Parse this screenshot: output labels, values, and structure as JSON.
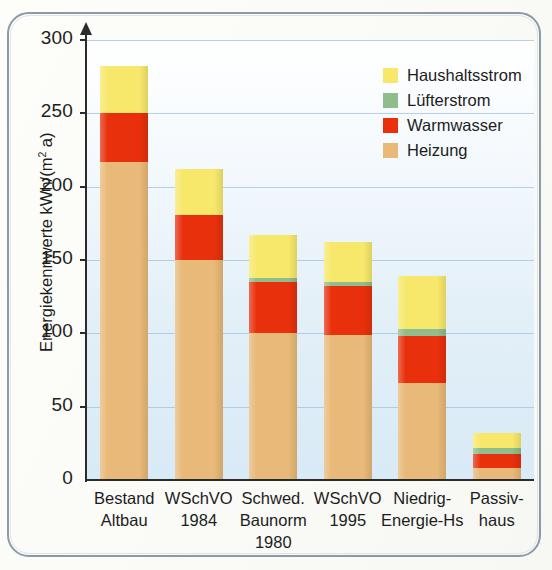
{
  "chart_data": {
    "type": "bar",
    "stacked": true,
    "title": "",
    "xlabel": "",
    "ylabel": "Energiekennwerte kWh/(m² a)",
    "ylim": [
      0,
      300
    ],
    "yticks": [
      0,
      50,
      100,
      150,
      200,
      250,
      300
    ],
    "grid": true,
    "legend_position": "top-right",
    "categories": [
      "Bestand Altbau",
      "WSchVO 1984",
      "Schwed. Baunorm 1980",
      "WSchVO 1995",
      "Niedrig-Energie-Hs",
      "Passivhaus"
    ],
    "category_lines": [
      [
        "Bestand",
        "Altbau"
      ],
      [
        "WSchVO",
        "1984"
      ],
      [
        "Schwed.",
        "Baunorm",
        "1980"
      ],
      [
        "WSchVO",
        "1995"
      ],
      [
        "Niedrig-",
        "Energie-Hs"
      ],
      [
        "Passiv-",
        "haus"
      ]
    ],
    "series": [
      {
        "name": "Heizung",
        "color": "#e8b978",
        "values": [
          217,
          150,
          100,
          99,
          66,
          8
        ]
      },
      {
        "name": "Warmwasser",
        "color": "#e8300c",
        "values": [
          33,
          31,
          35,
          33,
          32,
          10
        ]
      },
      {
        "name": "Lüfterstrom",
        "color": "#8fbd8c",
        "values": [
          0,
          0,
          3,
          3,
          5,
          4
        ]
      },
      {
        "name": "Haushaltsstrom",
        "color": "#f7e86b",
        "values": [
          32,
          31,
          29,
          27,
          36,
          10
        ]
      }
    ],
    "totals": [
      282,
      212,
      167,
      162,
      139,
      32
    ]
  },
  "legend": {
    "items": [
      {
        "label": "Haushaltsstrom",
        "color": "#f7e86b"
      },
      {
        "label": "Lüfterstrom",
        "color": "#8fbd8c"
      },
      {
        "label": "Warmwasser",
        "color": "#e8300c"
      },
      {
        "label": "Heizung",
        "color": "#e8b978"
      }
    ]
  },
  "axis": {
    "y_title_main": "Energiekennwerte kWh/(m",
    "y_title_sup": "2",
    "y_title_tail": " a)"
  },
  "colors": {
    "heizung": "#e8b978",
    "warmwasser": "#e8300c",
    "luefterstrom": "#8fbd8c",
    "haushaltsstrom": "#f7e86b",
    "grid": "#9cc3dd",
    "axis": "#2b2b2b",
    "frame": "#8a9aa6"
  }
}
